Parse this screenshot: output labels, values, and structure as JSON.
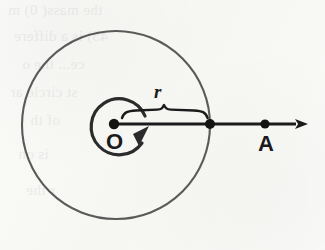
{
  "figure": {
    "kind": "geometry-diagram",
    "canvas": {
      "width": 325,
      "height": 250
    },
    "background_color": "#f8f8f6",
    "ink_color": "#2b2b2b",
    "labels": {
      "radius": "r",
      "center": "O",
      "point_a": "A"
    },
    "elements": {
      "outer_circle": {
        "name": "outer-circle",
        "center_x": 116,
        "center_y": 125,
        "radius": 94,
        "stroke_width": 2.1,
        "stroke_color": "#5a5a5a"
      },
      "rotation_arc": {
        "name": "rotation-arc",
        "center_x": 121,
        "center_y": 128,
        "radius": 28,
        "stroke_width": 3.2,
        "stroke_color": "#2b2b2b",
        "direction": "counterclockwise"
      },
      "ray": {
        "name": "direction-ray",
        "y": 124,
        "x_start": 114,
        "x_end": 308,
        "stroke_width": 3.0,
        "stroke_color": "#1b1b1b"
      },
      "brace": {
        "name": "radius-brace",
        "x_left": 122,
        "x_right": 207,
        "y": 113,
        "stroke_width": 2.4
      },
      "points": [
        {
          "name": "point-O",
          "label": "O",
          "x": 114,
          "y": 124,
          "dot_radius": 5.2
        },
        {
          "name": "point-circle-intersection",
          "label": "",
          "x": 210,
          "y": 124,
          "dot_radius": 5.0
        },
        {
          "name": "point-A",
          "label": "A",
          "x": 265,
          "y": 124,
          "dot_radius": 4.6
        }
      ]
    }
  },
  "ghost_text": {
    "lines": [
      "the mass( 0) m",
      "45) is a differe",
      "ce... the o",
      "st circle ar",
      "of th",
      "is  on",
      "r the"
    ]
  }
}
